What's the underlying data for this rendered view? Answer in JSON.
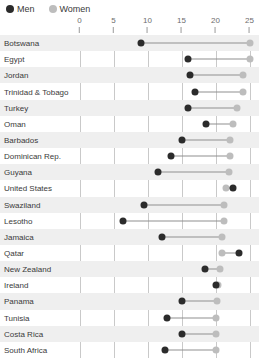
{
  "legend": {
    "items": [
      {
        "label": "Men",
        "color": "#2b2b2b",
        "key": "men"
      },
      {
        "label": "Women",
        "color": "#bdbdbd",
        "key": "women"
      }
    ]
  },
  "axis": {
    "ticks": [
      "0",
      "5",
      "10",
      "15",
      "20",
      "25"
    ]
  },
  "chart_data": {
    "type": "scatter",
    "title": "",
    "subtitle": "",
    "xlabel": "",
    "ylabel": "",
    "xlim": [
      0,
      25
    ],
    "ylim": null,
    "grid": true,
    "legend_position": "top-left",
    "xticks": [
      0,
      5,
      10,
      15,
      20,
      25
    ],
    "categories": [
      "Botswana",
      "Egypt",
      "Jordan",
      "Trinidad & Tobago",
      "Turkey",
      "Oman",
      "Barbados",
      "Dominican Rep.",
      "Guyana",
      "United States",
      "Swaziland",
      "Lesotho",
      "Jamaica",
      "Qatar",
      "New Zealand",
      "Ireland",
      "Panama",
      "Tunisia",
      "Costa Rica",
      "South Africa"
    ],
    "series": [
      {
        "name": "Men",
        "color": "#2b2b2b",
        "values": [
          9.1,
          16.0,
          16.2,
          17.0,
          16.0,
          18.6,
          15.0,
          13.5,
          11.6,
          22.6,
          9.5,
          6.4,
          12.1,
          23.5,
          18.5,
          20.0,
          15.0,
          12.8,
          15.1,
          12.5
        ]
      },
      {
        "name": "Women",
        "color": "#bdbdbd",
        "values": [
          25.0,
          25.0,
          24.0,
          24.0,
          23.2,
          22.6,
          22.2,
          22.1,
          22.0,
          21.6,
          21.3,
          21.2,
          21.0,
          21.0,
          20.7,
          20.4,
          20.2,
          20.1,
          20.1,
          20.0
        ]
      }
    ]
  }
}
